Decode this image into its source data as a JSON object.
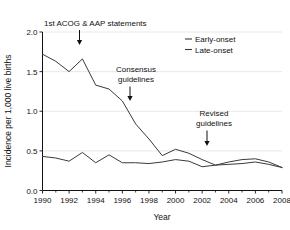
{
  "chart_data": {
    "type": "line",
    "title": "",
    "xlabel": "Year",
    "ylabel": "Incidence per 1,000 live births",
    "xlim": [
      1990,
      2008
    ],
    "ylim": [
      0.0,
      2.0
    ],
    "grid": true,
    "legend_position": "top-right",
    "x": [
      1990,
      1991,
      1992,
      1993,
      1994,
      1995,
      1996,
      1997,
      1998,
      1999,
      2000,
      2001,
      2002,
      2003,
      2004,
      2005,
      2006,
      2007,
      2008
    ],
    "xtick_labels": [
      "1990",
      "1992",
      "1994",
      "1996",
      "1998",
      "2000",
      "2002",
      "2004",
      "2006",
      "2008"
    ],
    "xtick_values": [
      1990,
      1992,
      1994,
      1996,
      1998,
      2000,
      2002,
      2004,
      2006,
      2008
    ],
    "xtick_minor_values": [
      1991,
      1993,
      1995,
      1997,
      1999,
      2001,
      2003,
      2005,
      2007
    ],
    "ytick_labels": [
      "0.0",
      "0.5",
      "1.0",
      "1.5",
      "2.0"
    ],
    "ytick_values": [
      0.0,
      0.5,
      1.0,
      1.5,
      2.0
    ],
    "series": [
      {
        "name": "Early-onset",
        "color": "#3a3a3a",
        "values": [
          1.72,
          1.63,
          1.5,
          1.66,
          1.33,
          1.28,
          1.13,
          0.84,
          0.65,
          0.44,
          0.52,
          0.47,
          0.39,
          0.32,
          0.33,
          0.34,
          0.36,
          0.33,
          0.29
        ]
      },
      {
        "name": "Late-onset",
        "color": "#3a3a3a",
        "values": [
          0.43,
          0.41,
          0.37,
          0.48,
          0.35,
          0.45,
          0.35,
          0.35,
          0.34,
          0.36,
          0.39,
          0.37,
          0.3,
          0.32,
          0.36,
          0.39,
          0.4,
          0.36,
          0.29
        ]
      }
    ],
    "annotations": [
      {
        "label_line1": "1st ACOG & AAP statements",
        "label_line2": "",
        "x": 1993,
        "arrow_to_y": 1.73
      },
      {
        "label_line1": "Consensus",
        "label_line2": "guidelines",
        "x": 1996.6,
        "arrow_to_y": 0.95
      },
      {
        "label_line1": "Revised",
        "label_line2": "guidelines",
        "x": 2002.8,
        "arrow_to_y": 0.42
      }
    ]
  },
  "legend": {
    "items": [
      {
        "label": "Early-onset"
      },
      {
        "label": "Late-onset"
      }
    ]
  }
}
